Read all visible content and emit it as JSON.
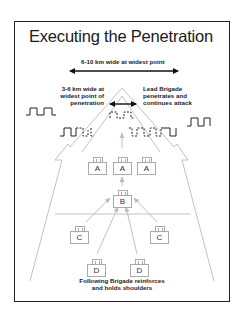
{
  "title": "Executing the Penetration",
  "labels": {
    "wide_point": "6-10 km wide at widest point",
    "penetration_width": [
      "3-6 km wide at",
      "widest point of",
      "penetration"
    ],
    "lead_brigade": [
      "Lead Brigade",
      "penetrates and",
      "continues attack"
    ],
    "following_brigade": [
      "Following Brigade reinforces",
      "and holds shoulders"
    ]
  },
  "units": [
    {
      "id": "A1",
      "label": "A",
      "x": 88,
      "y": 158
    },
    {
      "id": "A2",
      "label": "A",
      "x": 113,
      "y": 158
    },
    {
      "id": "A3",
      "label": "A",
      "x": 137,
      "y": 158
    },
    {
      "id": "B",
      "label": "B",
      "x": 113,
      "y": 191
    },
    {
      "id": "C1",
      "label": "C",
      "x": 70,
      "y": 227
    },
    {
      "id": "C2",
      "label": "C",
      "x": 150,
      "y": 227
    },
    {
      "id": "D1",
      "label": "D",
      "x": 87,
      "y": 260
    },
    {
      "id": "D2",
      "label": "D",
      "x": 130,
      "y": 260
    }
  ],
  "colors": {
    "frame": "#222222",
    "arrow_outline": "#bbbbbb",
    "enemy_line": "#222222",
    "text": "#222222"
  }
}
